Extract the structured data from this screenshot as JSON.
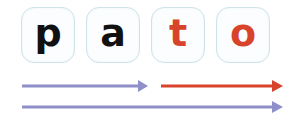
{
  "word": "pato",
  "tiles": [
    {
      "letter": "p",
      "color": "#111111"
    },
    {
      "letter": "a",
      "color": "#111111"
    },
    {
      "letter": "t",
      "color": "#d8442b"
    },
    {
      "letter": "o",
      "color": "#d8442b"
    }
  ],
  "arrows": [
    {
      "name": "arrow-syllable-pa",
      "color": "#8f8fca"
    },
    {
      "name": "arrow-syllable-to",
      "color": "#d8442b"
    },
    {
      "name": "arrow-whole-word",
      "color": "#8f8fca"
    }
  ]
}
